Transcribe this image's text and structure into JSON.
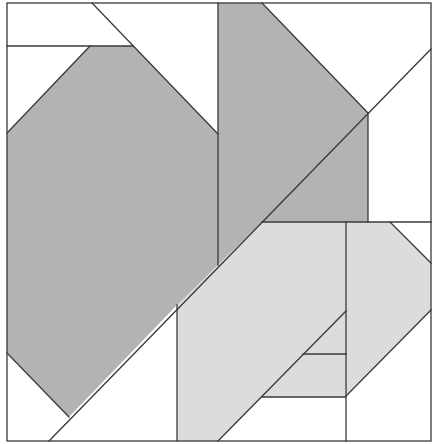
{
  "diagram": {
    "title": "",
    "type": "geometric tiling / tangram-style dissection",
    "frame": {
      "x1": 7,
      "y1": 3,
      "x2": 431,
      "y2": 441
    },
    "colors": {
      "background": "#ffffff",
      "dark_gray": "#b3b3b3",
      "light_gray": "#dcdcdc",
      "white": "#ffffff",
      "line": "#3a3a3a"
    },
    "regions": [
      {
        "id": "left-hexagon",
        "fill": "dark_gray",
        "points": "90,46 133,46 218,134 218,265 69,417 7,353 7,133"
      },
      {
        "id": "center-pentagon",
        "fill": "dark_gray",
        "points": "218,3 262,3 368,113 368,222 262,222 218,265"
      },
      {
        "id": "lower-parallelogram",
        "fill": "light_gray",
        "points": "262,222 346,222 346,311 262,397 218,441 177,441 177,305"
      },
      {
        "id": "lower-inner-trapezoid",
        "fill": "light_gray",
        "points": "346,311 346,397 262,397"
      },
      {
        "id": "right-hexagon",
        "fill": "light_gray",
        "points": "346,222 390,222 431,263 431,310 346,396"
      },
      {
        "id": "top-left-strip",
        "fill": "white",
        "points": "7,3 92,3 133,46 7,46"
      },
      {
        "id": "top-left-triangle",
        "fill": "white",
        "points": "7,46 90,46 7,133"
      },
      {
        "id": "top-right-region",
        "fill": "white",
        "points": "262,3 431,3 431,49 368,113"
      },
      {
        "id": "right-mid-region",
        "fill": "white",
        "points": "368,113 431,49 431,222 368,222"
      },
      {
        "id": "bottom-left-triangle",
        "fill": "white",
        "points": "7,353 69,417 49,441 7,441"
      },
      {
        "id": "bottom-center-triangle",
        "fill": "white",
        "points": "69,417 177,305 177,441 49,441"
      },
      {
        "id": "bottom-mid-region",
        "fill": "white",
        "points": "262,397 346,397 346,441 218,441"
      },
      {
        "id": "bottom-right-triangle",
        "fill": "white",
        "points": "346,396 431,310 431,441 346,441"
      },
      {
        "id": "right-corner-triangle",
        "fill": "white",
        "points": "390,222 431,222 431,263"
      }
    ],
    "lines": [
      {
        "id": "top-strip-line",
        "x1": 7,
        "y1": 46,
        "x2": 133,
        "y2": 46
      },
      {
        "id": "diag-top-left",
        "x1": 92,
        "y1": 3,
        "x2": 218,
        "y2": 134
      },
      {
        "id": "diag-hex-left",
        "x1": 90,
        "y1": 46,
        "x2": 7,
        "y2": 133
      },
      {
        "id": "vertical-218",
        "x1": 218,
        "y1": 3,
        "x2": 218,
        "y2": 265
      },
      {
        "id": "diag-center-top",
        "x1": 262,
        "y1": 3,
        "x2": 368,
        "y2": 113
      },
      {
        "id": "long-diagonal",
        "x1": 49,
        "y1": 441,
        "x2": 431,
        "y2": 49
      },
      {
        "id": "vertical-368",
        "x1": 368,
        "y1": 113,
        "x2": 368,
        "y2": 222
      },
      {
        "id": "horizontal-222",
        "x1": 262,
        "y1": 222,
        "x2": 431,
        "y2": 222
      },
      {
        "id": "diag-hex-bottom-left",
        "x1": 7,
        "y1": 353,
        "x2": 69,
        "y2": 417
      },
      {
        "id": "vertical-177",
        "x1": 177,
        "y1": 305,
        "x2": 177,
        "y2": 441
      },
      {
        "id": "vertical-346",
        "x1": 346,
        "y1": 222,
        "x2": 346,
        "y2": 441
      },
      {
        "id": "diag-right-top",
        "x1": 390,
        "y1": 222,
        "x2": 431,
        "y2": 263
      },
      {
        "id": "diag-right-bottom",
        "x1": 431,
        "y1": 310,
        "x2": 346,
        "y2": 396
      },
      {
        "id": "diag-inner",
        "x1": 346,
        "y1": 311,
        "x2": 218,
        "y2": 441
      },
      {
        "id": "horizontal-354",
        "x1": 303,
        "y1": 354,
        "x2": 346,
        "y2": 354
      },
      {
        "id": "horizontal-397",
        "x1": 262,
        "y1": 397,
        "x2": 346,
        "y2": 397
      }
    ]
  }
}
